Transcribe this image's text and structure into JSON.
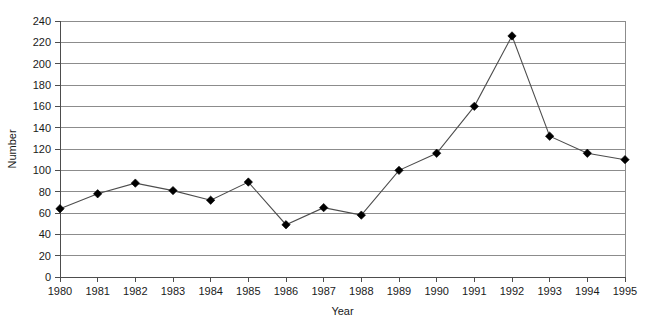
{
  "chart_data": {
    "type": "line",
    "title": "",
    "xlabel": "Year",
    "ylabel": "Number",
    "x": [
      1980,
      1981,
      1982,
      1983,
      1984,
      1985,
      1986,
      1987,
      1988,
      1989,
      1990,
      1991,
      1992,
      1993,
      1994,
      1995
    ],
    "categories": [
      "1980",
      "1981",
      "1982",
      "1983",
      "1984",
      "1985",
      "1986",
      "1987",
      "1988",
      "1989",
      "1990",
      "1991",
      "1992",
      "1993",
      "1994",
      "1995"
    ],
    "values": [
      64,
      78,
      88,
      81,
      72,
      89,
      49,
      65,
      58,
      100,
      116,
      160,
      226,
      132,
      116,
      110
    ],
    "series": [
      {
        "name": "Number",
        "values": [
          64,
          78,
          88,
          81,
          72,
          89,
          49,
          65,
          58,
          100,
          116,
          160,
          226,
          132,
          116,
          110
        ]
      }
    ],
    "ylim": [
      0,
      240
    ],
    "ytick_step": 20,
    "yticks": [
      0,
      20,
      40,
      60,
      80,
      100,
      120,
      140,
      160,
      180,
      200,
      220,
      240
    ],
    "ytick_labels": [
      "0",
      "20",
      "40",
      "60",
      "80",
      "100",
      "120",
      "140",
      "160",
      "180",
      "200",
      "220",
      "240"
    ],
    "grid": "horizontal",
    "legend": "none",
    "marker": "diamond",
    "line_color": "#4d4d4d",
    "marker_color": "#000000",
    "grid_color": "#8c8c8c",
    "axis_color": "#4d4d4d",
    "background_color": "#ffffff"
  }
}
